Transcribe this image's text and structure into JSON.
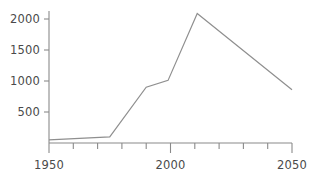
{
  "chart_data": {
    "type": "line",
    "title": "",
    "subtitle": "",
    "xlabel": "",
    "ylabel": "",
    "xlim": [
      1950,
      2050
    ],
    "ylim": [
      0,
      2200
    ],
    "grid": false,
    "legend": null,
    "x_ticks": [
      1950,
      1960,
      1970,
      1980,
      1990,
      2000,
      2010,
      2020,
      2030,
      2040,
      2050
    ],
    "x_tick_labels": [
      "1950",
      "",
      "",
      "",
      "",
      "2000",
      "",
      "",
      "",
      "",
      "2050"
    ],
    "y_ticks": [
      500,
      1000,
      1500,
      2000
    ],
    "y_tick_labels": [
      "500",
      "1000",
      "1500",
      "2000"
    ],
    "series": [
      {
        "name": "series-1",
        "color": "#8f8f8f",
        "x": [
          1950,
          1975,
          1990,
          1999,
          2011,
          2050
        ],
        "values": [
          50,
          100,
          900,
          1010,
          2090,
          860
        ]
      }
    ],
    "annotations": []
  },
  "axes": {
    "y_axis_name": "y-axis",
    "x_axis_name": "x-axis"
  }
}
